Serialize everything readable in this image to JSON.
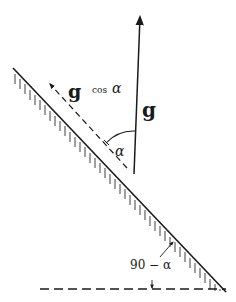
{
  "diagram": {
    "type": "inclined-plane-vector-decomposition",
    "labels": {
      "g_vector": "g",
      "component_g": "g",
      "component_cos": "cos",
      "component_alpha": "α",
      "angle_alpha": "α",
      "angle_incline": "90 − α"
    },
    "colors": {
      "ink": "#1a1a1a",
      "background": "#ffffff"
    },
    "elements": [
      {
        "name": "inclined-plane",
        "desc": "hatched sloped surface descending left to right"
      },
      {
        "name": "gravity-vector",
        "desc": "vertical arrow labeled g"
      },
      {
        "name": "component-vector",
        "desc": "dashed arrow along the incline labeled g cos α"
      },
      {
        "name": "angle-arc-alpha",
        "desc": "arc between g and component, labeled α"
      },
      {
        "name": "horizontal-reference",
        "desc": "dashed horizontal baseline"
      },
      {
        "name": "angle-label-incline",
        "desc": "90 − α angle between incline and horizontal"
      }
    ]
  }
}
